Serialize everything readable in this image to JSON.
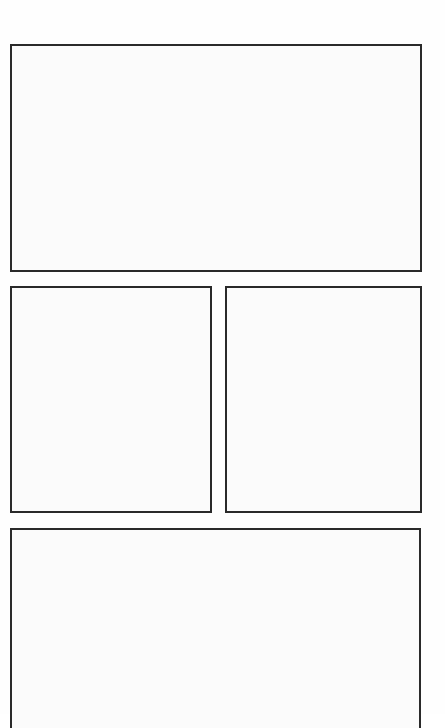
{
  "page": {
    "type": "comic-panel-layout",
    "panels": [
      {
        "id": "top",
        "content": ""
      },
      {
        "id": "middle-left",
        "content": ""
      },
      {
        "id": "middle-right",
        "content": ""
      },
      {
        "id": "bottom",
        "content": ""
      }
    ],
    "colors": {
      "border": "#2a2a2a",
      "panel_fill": "#fbfbfb",
      "background": "#ffffff"
    }
  }
}
